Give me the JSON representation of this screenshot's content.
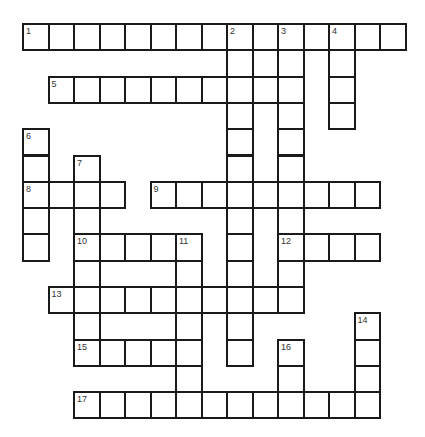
{
  "puzzle": {
    "type": "crossword",
    "cols": 15,
    "rows": 15,
    "origin_x": 23,
    "origin_y": 24,
    "cell_w": 25.5,
    "cell_h": 26.3,
    "line_color": "#1a1a1a",
    "number_color": "#333333"
  },
  "entries": [
    {
      "number": 1,
      "direction": "across",
      "row": 0,
      "col": 0,
      "length": 15
    },
    {
      "number": 2,
      "direction": "down",
      "row": 0,
      "col": 8,
      "length": 13
    },
    {
      "number": 3,
      "direction": "down",
      "row": 0,
      "col": 10,
      "length": 11
    },
    {
      "number": 4,
      "direction": "down",
      "row": 0,
      "col": 12,
      "length": 4
    },
    {
      "number": 5,
      "direction": "across",
      "row": 2,
      "col": 1,
      "length": 10
    },
    {
      "number": 6,
      "direction": "down",
      "row": 4,
      "col": 0,
      "length": 5
    },
    {
      "number": 7,
      "direction": "down",
      "row": 5,
      "col": 2,
      "length": 8
    },
    {
      "number": 8,
      "direction": "across",
      "row": 6,
      "col": 0,
      "length": 4
    },
    {
      "number": 9,
      "direction": "across",
      "row": 6,
      "col": 5,
      "length": 9
    },
    {
      "number": 10,
      "direction": "across",
      "row": 8,
      "col": 2,
      "length": 5
    },
    {
      "number": 11,
      "direction": "down",
      "row": 8,
      "col": 6,
      "length": 7
    },
    {
      "number": 12,
      "direction": "across",
      "row": 8,
      "col": 10,
      "length": 4
    },
    {
      "number": 13,
      "direction": "across",
      "row": 10,
      "col": 1,
      "length": 10
    },
    {
      "number": 14,
      "direction": "down",
      "row": 11,
      "col": 13,
      "length": 4
    },
    {
      "number": 15,
      "direction": "across",
      "row": 12,
      "col": 2,
      "length": 5
    },
    {
      "number": 16,
      "direction": "down",
      "row": 12,
      "col": 10,
      "length": 3
    },
    {
      "number": 17,
      "direction": "across",
      "row": 14,
      "col": 2,
      "length": 12
    }
  ]
}
